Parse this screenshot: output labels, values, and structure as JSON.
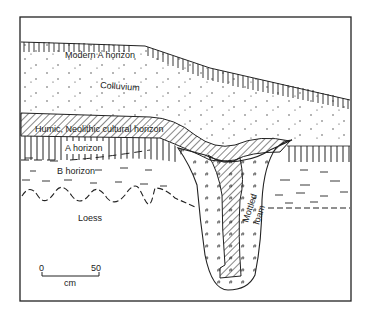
{
  "diagram": {
    "type": "soil-section",
    "layers": [
      {
        "id": "modern-a",
        "label": "Modern A horizon"
      },
      {
        "id": "colluvium",
        "label": "Colluvium"
      },
      {
        "id": "humic",
        "label": "Humic, Neolithic cultural horizon"
      },
      {
        "id": "a-horizon",
        "label": "A horizon"
      },
      {
        "id": "b-horizon",
        "label": "B horizon"
      },
      {
        "id": "loess",
        "label": "Loess"
      },
      {
        "id": "mottled",
        "label_line1": "Mottled",
        "label_line2": "loam"
      }
    ],
    "scale_bar": {
      "start": "0",
      "end": "50",
      "unit": "cm"
    }
  },
  "colors": {
    "ink": "#222222",
    "background": "#ffffff"
  }
}
